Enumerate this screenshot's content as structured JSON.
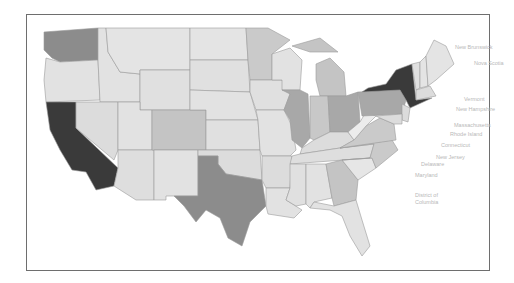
{
  "map": {
    "type": "choropleth",
    "region": "United States",
    "palette": {
      "lowest": "#e6e6e6",
      "low": "#d6d6d6",
      "medium_low": "#c4c4c4",
      "medium": "#a8a8a8",
      "high": "#8c8c8c",
      "highest": "#3a3a3a"
    },
    "states": [
      {
        "name": "California",
        "shade": "highest"
      },
      {
        "name": "New York",
        "shade": "highest"
      },
      {
        "name": "Texas",
        "shade": "high"
      },
      {
        "name": "Washington",
        "shade": "high"
      },
      {
        "name": "Illinois",
        "shade": "medium"
      },
      {
        "name": "Ohio",
        "shade": "medium"
      },
      {
        "name": "Pennsylvania",
        "shade": "medium"
      },
      {
        "name": "Michigan",
        "shade": "medium_low"
      },
      {
        "name": "Georgia",
        "shade": "medium_low"
      },
      {
        "name": "Colorado",
        "shade": "medium_low"
      },
      {
        "name": "Minnesota",
        "shade": "medium_low"
      },
      {
        "name": "Indiana",
        "shade": "medium_low"
      },
      {
        "name": "North Carolina",
        "shade": "medium_low"
      },
      {
        "name": "Virginia",
        "shade": "medium_low"
      },
      {
        "name": "Other states",
        "shade": "lowest"
      }
    ],
    "labels": [
      {
        "text": "New Brunswick",
        "x": 455,
        "y": 46
      },
      {
        "text": "Nova Scotia",
        "x": 474,
        "y": 62
      },
      {
        "text": "Vermont",
        "x": 464,
        "y": 98
      },
      {
        "text": "New Hampshire",
        "x": 456,
        "y": 108
      },
      {
        "text": "Massachusetts",
        "x": 454,
        "y": 124
      },
      {
        "text": "Rhode Island",
        "x": 450,
        "y": 133
      },
      {
        "text": "Connecticut",
        "x": 441,
        "y": 144
      },
      {
        "text": "New Jersey",
        "x": 436,
        "y": 156
      },
      {
        "text": "Delaware",
        "x": 421,
        "y": 163
      },
      {
        "text": "Maryland",
        "x": 415,
        "y": 174
      },
      {
        "text": "District of",
        "x": 415,
        "y": 194
      },
      {
        "text": "Columbia",
        "x": 415,
        "y": 201
      }
    ]
  }
}
